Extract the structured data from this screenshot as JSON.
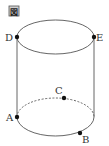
{
  "figure_label": "図",
  "shape": "cylinder",
  "colors": {
    "stroke": "#555555",
    "point": "#111111",
    "label_bg": "#cccccc"
  },
  "points": {
    "A": {
      "label": "A",
      "x": 17,
      "y": 117
    },
    "B": {
      "label": "B",
      "x": 80,
      "y": 133
    },
    "C": {
      "label": "C",
      "x": 64,
      "y": 97
    },
    "D": {
      "label": "D",
      "x": 17,
      "y": 37
    },
    "E": {
      "label": "E",
      "x": 94,
      "y": 37
    }
  }
}
